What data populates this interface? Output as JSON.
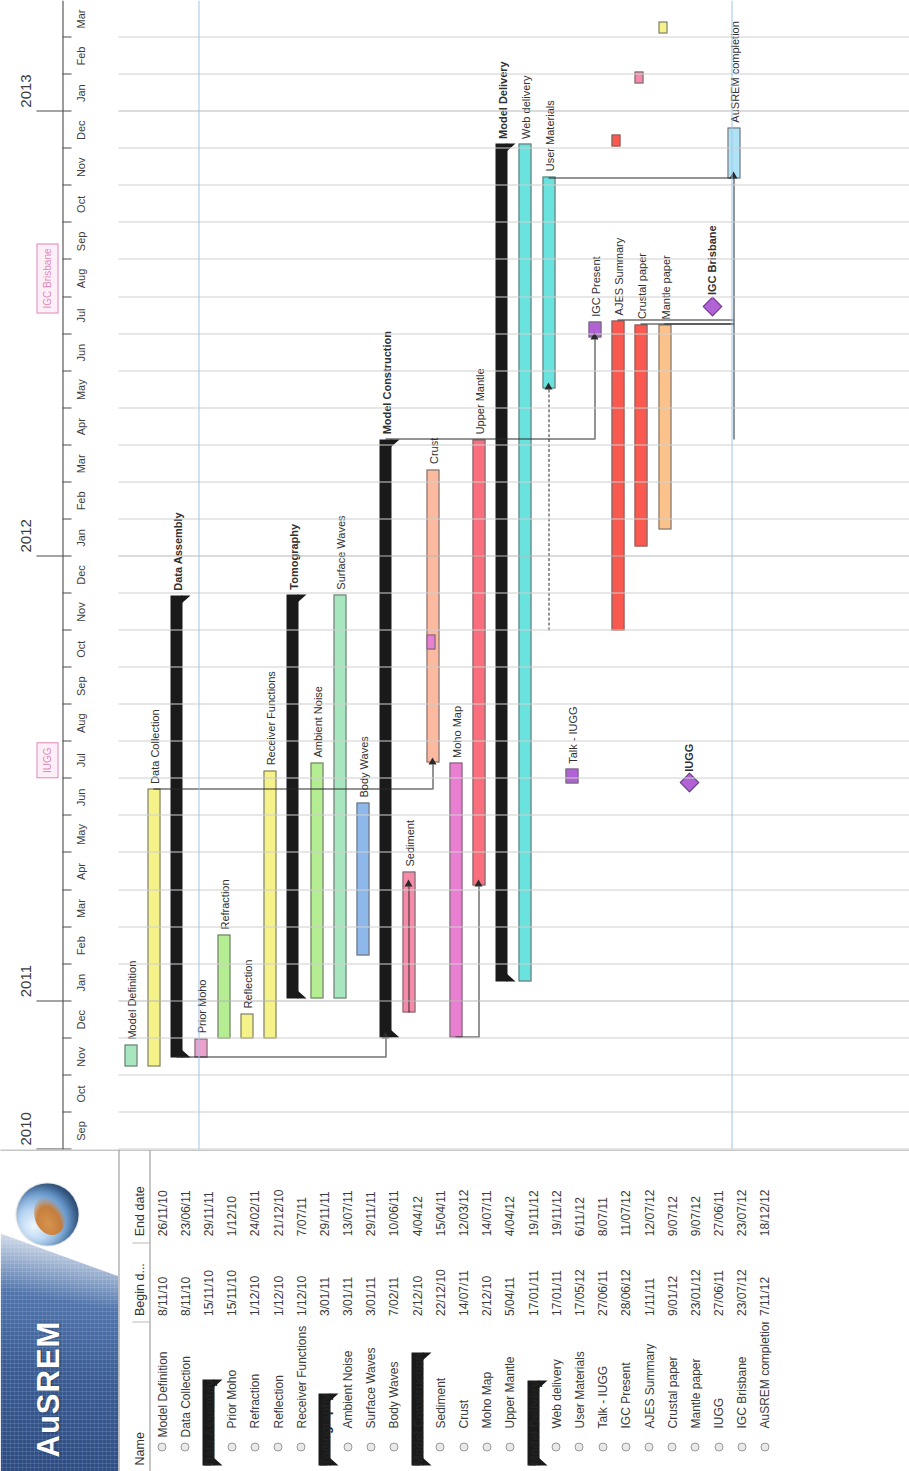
{
  "app": {
    "logo_text": "AuSREM",
    "logo_icon": "globe-icon"
  },
  "table": {
    "headers": {
      "name": "Name",
      "begin": "Begin d...",
      "end": "End date"
    }
  },
  "timeline": {
    "years": [
      {
        "label": "2010",
        "month_index": 0
      },
      {
        "label": "2011",
        "month_index": 4
      },
      {
        "label": "2012",
        "month_index": 16
      },
      {
        "label": "2013",
        "month_index": 28
      }
    ],
    "months": [
      "Sep",
      "Oct",
      "Nov",
      "Dec",
      "Jan",
      "Feb",
      "Mar",
      "Apr",
      "May",
      "Jun",
      "Jul",
      "Aug",
      "Sep",
      "Oct",
      "Nov",
      "Dec",
      "Jan",
      "Feb",
      "Mar",
      "Apr",
      "May",
      "Jun",
      "Jul",
      "Aug",
      "Sep",
      "Oct",
      "Nov",
      "Dec",
      "Jan",
      "Feb",
      "Mar"
    ],
    "event_markers": [
      {
        "label": "IUGG",
        "month_index": 10,
        "color": "#e089bb"
      },
      {
        "label": "IGC Brisbane",
        "month_index": 23,
        "color": "#e089bb"
      }
    ]
  },
  "chart_data": {
    "type": "bar",
    "xlabel": "",
    "ylabel": "",
    "x_range": [
      "Sep 2010",
      "Mar 2013"
    ],
    "grid": true,
    "legend": "none",
    "tasks": [
      {
        "name": "Model Definition",
        "begin": "8/11/10",
        "end": "26/11/10",
        "start": 2.23,
        "span": 0.6,
        "color": "#a8e6c0",
        "kind": "task",
        "level": 0,
        "expandable": false,
        "label": "Model Definition"
      },
      {
        "name": "Data Collection",
        "begin": "8/11/10",
        "end": "23/06/11",
        "start": 2.23,
        "span": 7.5,
        "color": "#f5f28a",
        "kind": "task",
        "level": 0,
        "expandable": false,
        "label": "Data Collection"
      },
      {
        "name": "Data Assembly",
        "begin": "15/11/10",
        "end": "29/11/11",
        "start": 2.47,
        "span": 12.47,
        "color": "#1a1a1a",
        "kind": "summary",
        "level": 0,
        "expandable": true,
        "label": "Data Assembly"
      },
      {
        "name": "Prior Moho",
        "begin": "15/11/10",
        "end": "1/12/10",
        "start": 2.47,
        "span": 0.53,
        "color": "#eda0cb",
        "kind": "task",
        "level": 1,
        "expandable": false,
        "label": "Prior Moho"
      },
      {
        "name": "Refraction",
        "begin": "1/12/10",
        "end": "24/02/11",
        "start": 3.0,
        "span": 2.8,
        "color": "#b5ed93",
        "kind": "task",
        "level": 1,
        "expandable": false,
        "label": "Refraction"
      },
      {
        "name": "Reflection",
        "begin": "1/12/10",
        "end": "21/12/10",
        "start": 3.0,
        "span": 0.67,
        "color": "#f5f28a",
        "kind": "task",
        "level": 1,
        "expandable": false,
        "label": "Reflection"
      },
      {
        "name": "Receiver Functions",
        "begin": "1/12/10",
        "end": "7/07/11",
        "start": 3.0,
        "span": 7.23,
        "color": "#f5f28a",
        "kind": "task",
        "level": 1,
        "expandable": false,
        "label": "Receiver Functions"
      },
      {
        "name": "Tomography",
        "begin": "3/01/11",
        "end": "29/11/11",
        "start": 4.07,
        "span": 10.9,
        "color": "#1a1a1a",
        "kind": "summary",
        "level": 0,
        "expandable": true,
        "label": "Tomography"
      },
      {
        "name": "Ambient Noise",
        "begin": "3/01/11",
        "end": "13/07/11",
        "start": 4.07,
        "span": 6.37,
        "color": "#b5ed93",
        "kind": "task",
        "level": 1,
        "expandable": false,
        "label": "Ambient Noise"
      },
      {
        "name": "Surface Waves",
        "begin": "3/01/11",
        "end": "29/11/11",
        "start": 4.07,
        "span": 10.9,
        "color": "#a8e6c0",
        "kind": "task",
        "level": 1,
        "expandable": false,
        "label": "Surface Waves"
      },
      {
        "name": "Body Waves",
        "begin": "7/02/11",
        "end": "10/06/11",
        "start": 5.23,
        "span": 4.13,
        "color": "#8fb8ea",
        "kind": "task",
        "level": 1,
        "expandable": false,
        "label": "Body Waves"
      },
      {
        "name": "Model Construction",
        "begin": "2/12/10",
        "end": "4/04/12",
        "start": 3.03,
        "span": 16.13,
        "color": "#1a1a1a",
        "kind": "summary",
        "level": 0,
        "expandable": true,
        "label": "Model Construction"
      },
      {
        "name": "Sediment",
        "begin": "22/12/10",
        "end": "15/04/11",
        "start": 3.7,
        "span": 3.8,
        "color": "#f58ba8",
        "kind": "task",
        "level": 1,
        "expandable": false,
        "label": "Sediment"
      },
      {
        "name": "Crust",
        "begin": "14/07/11",
        "end": "12/03/12",
        "start": 10.43,
        "span": 7.93,
        "color": "#fbb9a0",
        "kind": "task",
        "level": 1,
        "expandable": false,
        "label": "Crust"
      },
      {
        "name": "Moho Map",
        "begin": "2/12/10",
        "end": "14/07/11",
        "start": 3.03,
        "span": 7.4,
        "color": "#e87fd0",
        "kind": "task",
        "level": 1,
        "expandable": false,
        "label": "Moho Map"
      },
      {
        "name": "Upper Mantle",
        "begin": "5/04/11",
        "end": "4/04/12",
        "start": 7.13,
        "span": 12.03,
        "color": "#fa6f7e",
        "kind": "task",
        "level": 1,
        "expandable": false,
        "label": "Upper Mantle"
      },
      {
        "name": "Model Delivery",
        "begin": "17/01/11",
        "end": "19/11/12",
        "start": 4.53,
        "span": 22.6,
        "color": "#1a1a1a",
        "kind": "summary",
        "level": 0,
        "expandable": true,
        "label": "Model Delivery"
      },
      {
        "name": "Web delivery",
        "begin": "17/01/11",
        "end": "19/11/12",
        "start": 4.53,
        "span": 22.6,
        "color": "#6ae3de",
        "kind": "task",
        "level": 1,
        "expandable": false,
        "label": "Web delivery"
      },
      {
        "name": "User Materials",
        "begin": "17/05/12",
        "end": "6/11/12",
        "start": 20.53,
        "span": 5.73,
        "color": "#6ae3de",
        "kind": "task",
        "level": 1,
        "expandable": false,
        "label": "User Materials"
      },
      {
        "name": "Talk - IUGG",
        "begin": "27/06/11",
        "end": "8/07/11",
        "start": 9.87,
        "span": 0.4,
        "color": "#b163d6",
        "kind": "task",
        "level": 1,
        "expandable": false,
        "label": "Talk - IUGG"
      },
      {
        "name": "IGC Present",
        "begin": "28/06/12",
        "end": "11/07/12",
        "start": 21.9,
        "span": 0.43,
        "color": "#b163d6",
        "kind": "task",
        "level": 1,
        "expandable": false,
        "label": "IGC Present"
      },
      {
        "name": "AJES Summary",
        "begin": "1/11/11",
        "end": "12/07/12",
        "start": 14.0,
        "span": 8.37,
        "color": "#f9594f",
        "kind": "task",
        "level": 1,
        "expandable": false,
        "label": "AJES Summary"
      },
      {
        "name": "Crustal paper",
        "begin": "9/01/12",
        "end": "9/07/12",
        "start": 16.27,
        "span": 6.0,
        "color": "#f9594f",
        "kind": "task",
        "level": 1,
        "expandable": false,
        "label": "Crustal paper"
      },
      {
        "name": "Mantle paper",
        "begin": "23/01/12",
        "end": "9/07/12",
        "start": 16.73,
        "span": 5.53,
        "color": "#fcc28c",
        "kind": "task",
        "level": 1,
        "expandable": false,
        "label": "Mantle paper"
      },
      {
        "name": "IUGG",
        "begin": "27/06/11",
        "end": "27/06/11",
        "start": 9.87,
        "span": 0.0,
        "color": "#b163d6",
        "kind": "milestone",
        "level": 1,
        "expandable": false,
        "label": "IUGG"
      },
      {
        "name": "IGC Brisbane",
        "begin": "23/07/12",
        "end": "23/07/12",
        "start": 22.73,
        "span": 0.0,
        "color": "#b163d6",
        "kind": "milestone",
        "level": 1,
        "expandable": false,
        "label": "IGC Brisbane"
      },
      {
        "name": "AuSREM completion",
        "begin": "7/11/12",
        "end": "18/12/12",
        "start": 26.2,
        "span": 1.37,
        "color": "#b0e2f5",
        "kind": "task",
        "level": 1,
        "expandable": false,
        "label": "AuSREM completion"
      }
    ],
    "stub_markers": [
      {
        "row": 21,
        "start": 27.05,
        "span": 0.33,
        "color": "#f9594f",
        "name": "ajes-summary-stub"
      },
      {
        "row": 22,
        "start": 28.75,
        "span": 0.33,
        "color": "#f58ba8",
        "name": "crustal-paper-stub"
      },
      {
        "row": 23,
        "start": 30.1,
        "span": 0.33,
        "color": "#f5f28a",
        "name": "mantle-paper-stub"
      },
      {
        "row": 13,
        "start": 13.5,
        "span": 0.4,
        "color": "#e87fd0",
        "name": "crust-stub"
      }
    ]
  }
}
